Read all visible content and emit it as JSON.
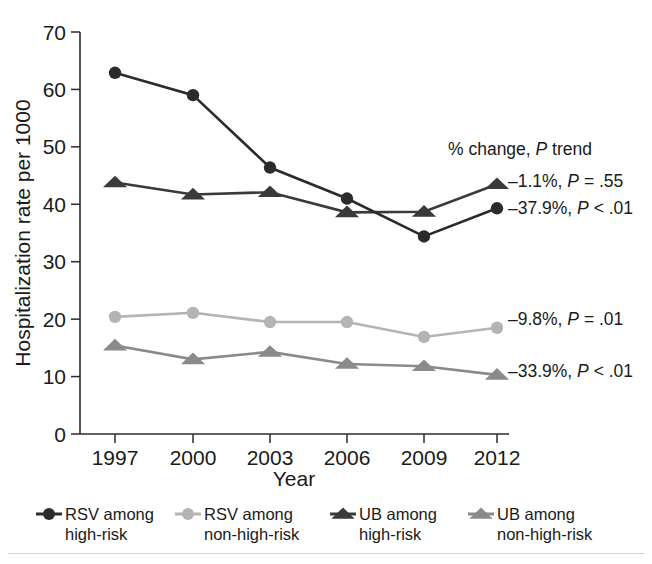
{
  "chart_data": {
    "type": "line",
    "title": "",
    "xlabel": "Year",
    "ylabel": "Hospitalization rate per 1000",
    "categories": [
      "1997",
      "2000",
      "2003",
      "2006",
      "2009",
      "2012"
    ],
    "x": [
      1997,
      2000,
      2003,
      2006,
      2009,
      2012
    ],
    "xlim": [
      1996,
      2013
    ],
    "ylim": [
      0,
      70
    ],
    "yticks": [
      0,
      10,
      20,
      30,
      40,
      50,
      60,
      70
    ],
    "ytick_labels": [
      "0",
      "10",
      "20",
      "30",
      "40",
      "50",
      "60",
      "70"
    ],
    "grid": false,
    "legend_position": "bottom",
    "series": [
      {
        "name": "RSV among high-risk",
        "marker": "circle",
        "color": "#2b2b2b",
        "values": [
          62.9,
          59.0,
          46.4,
          41.0,
          34.4,
          39.3
        ],
        "annotation": "–37.9%, P < .01"
      },
      {
        "name": "RSV among non-high-risk",
        "marker": "circle",
        "color": "#b4b4b4",
        "values": [
          20.4,
          21.1,
          19.5,
          19.5,
          16.9,
          18.5
        ],
        "annotation": "–9.8%, P = .01"
      },
      {
        "name": "UB among high-risk",
        "marker": "triangle",
        "color": "#3a3a3a",
        "values": [
          43.8,
          41.7,
          42.1,
          38.6,
          38.7,
          43.5
        ],
        "annotation": "–1.1%, P = .55"
      },
      {
        "name": "UB among non-high-risk",
        "marker": "triangle",
        "color": "#8a8a8a",
        "values": [
          15.4,
          13.0,
          14.3,
          12.2,
          11.8,
          10.3
        ],
        "annotation": "–33.9%, P < .01"
      }
    ],
    "annotations": [
      {
        "id": "header",
        "text_plain": "% change, P trend",
        "pre": "% change, ",
        "ital": "P",
        "post": " trend"
      },
      {
        "id": "ub-high",
        "pre": "–1.1%, ",
        "ital": "P",
        "post": " = .55"
      },
      {
        "id": "rsv-high",
        "pre": "–37.9%, ",
        "ital": "P",
        "post": " < .01"
      },
      {
        "id": "rsv-nonhigh",
        "pre": "–9.8%, ",
        "ital": "P",
        "post": " = .01"
      },
      {
        "id": "ub-nonhigh",
        "pre": "–33.9%, ",
        "ital": "P",
        "post": " < .01"
      }
    ]
  },
  "legend": {
    "items": [
      {
        "line1": "RSV among",
        "line2": "high-risk",
        "marker": "circle",
        "color": "#2b2b2b"
      },
      {
        "line1": "RSV among",
        "line2": "non-high-risk",
        "marker": "circle",
        "color": "#b4b4b4"
      },
      {
        "line1": "UB among",
        "line2": "high-risk",
        "marker": "triangle",
        "color": "#3a3a3a"
      },
      {
        "line1": "UB among",
        "line2": "non-high-risk",
        "marker": "triangle",
        "color": "#8a8a8a"
      }
    ]
  },
  "colors": {
    "axis": "#2b2b2b",
    "text": "#1a1a1a",
    "background": "#ffffff",
    "rule": "#d2d2d2"
  }
}
